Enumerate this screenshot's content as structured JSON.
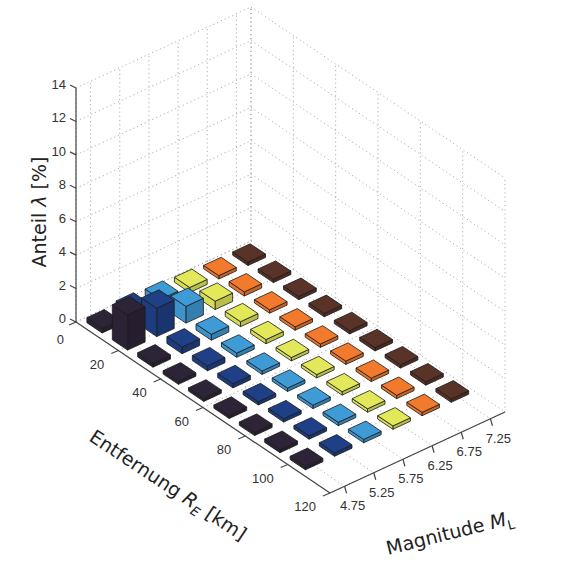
{
  "chart_data": {
    "type": "bar3d",
    "title": "",
    "zlabel": "Anteil λ [%]",
    "xlabel": "Entfernung R_E [km]",
    "ylabel": "Magnitude M_L",
    "zlabel_parts": {
      "main": "Anteil ",
      "symbol": "λ",
      "unit": " [%]"
    },
    "xlabel_parts": {
      "main": "Entfernung ",
      "sym": "R",
      "sub": "E",
      "unit": " [km]"
    },
    "ylabel_parts": {
      "main": "Magnitude ",
      "sym": "M",
      "sub": "L"
    },
    "zlim": [
      0,
      14
    ],
    "z_ticks": [
      0,
      2,
      4,
      6,
      8,
      10,
      12,
      14
    ],
    "x_range": [
      0,
      120
    ],
    "x_ticks": [
      0,
      20,
      40,
      60,
      80,
      100,
      120
    ],
    "y_range": [
      4.5,
      7.5
    ],
    "y_ticks": [
      4.75,
      5.25,
      5.75,
      6.25,
      6.75,
      7.25
    ],
    "y_tick_labels": [
      "4.75",
      "5.25",
      "5.75",
      "6.25",
      "6.75",
      "7.25"
    ],
    "grid": true,
    "distance_bin_centers_km": [
      6,
      18,
      30,
      42,
      54,
      66,
      78,
      90,
      102
    ],
    "distance_bin_width_km": 12,
    "magnitude_bin_centers": [
      4.75,
      5.25,
      5.75,
      6.25,
      6.75,
      7.25
    ],
    "magnitude_bin_width": 0.5,
    "series_colors": [
      "#2e2438",
      "#1f3f86",
      "#3f9bd6",
      "#e2e85a",
      "#f27a2c",
      "#5a3328"
    ],
    "values": [
      [
        0.3,
        0.5,
        0.4,
        0.3,
        0.2,
        0.2
      ],
      [
        2.1,
        1.7,
        1.0,
        0.5,
        0.25,
        0.2
      ],
      [
        0.25,
        0.4,
        0.35,
        0.3,
        0.2,
        0.2
      ],
      [
        0.2,
        0.3,
        0.25,
        0.25,
        0.2,
        0.2
      ],
      [
        0.2,
        0.25,
        0.2,
        0.2,
        0.2,
        0.2
      ],
      [
        0.2,
        0.2,
        0.2,
        0.2,
        0.2,
        0.2
      ],
      [
        0.2,
        0.2,
        0.2,
        0.2,
        0.2,
        0.2
      ],
      [
        0.2,
        0.2,
        0.2,
        0.2,
        0.2,
        0.2
      ],
      [
        0.2,
        0.2,
        0.2,
        0.2,
        0.2,
        0.2
      ]
    ],
    "values_note_rows": "rows = distance bins (near 0 km first), columns = magnitude bins (4.75 first)"
  }
}
